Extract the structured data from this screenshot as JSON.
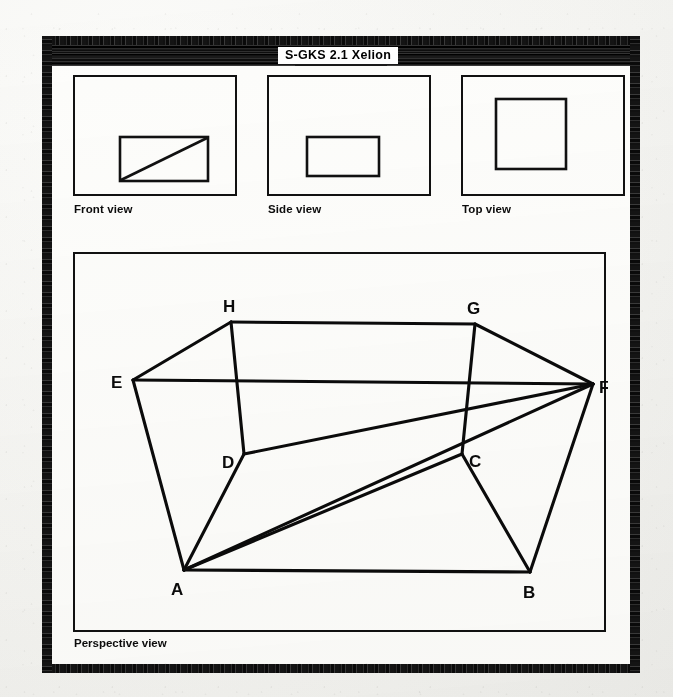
{
  "window": {
    "title": "S-GKS 2.1  Xelion"
  },
  "ortho_views": [
    {
      "name": "front-view",
      "label": "Front view",
      "shape": "rectangle-with-diagonal"
    },
    {
      "name": "side-view",
      "label": "Side view",
      "shape": "rectangle"
    },
    {
      "name": "top-view",
      "label": "Top view",
      "shape": "square"
    }
  ],
  "perspective_view": {
    "label": "Perspective view",
    "vertex_labels": [
      "A",
      "B",
      "C",
      "D",
      "E",
      "F",
      "G",
      "H"
    ],
    "line_color": "#0b0b0b"
  }
}
